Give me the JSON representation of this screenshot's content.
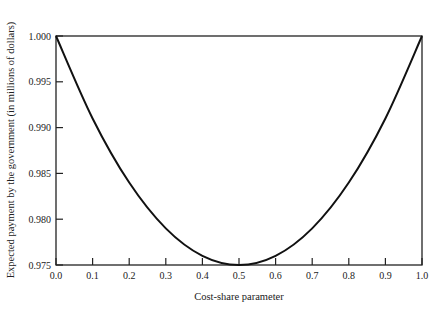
{
  "chart_data": {
    "type": "line",
    "title": "",
    "xlabel": "Cost-share parameter",
    "ylabel": "Expected payment by the government (in millions of dollars)",
    "xlim": [
      0.0,
      1.0
    ],
    "ylim": [
      0.975,
      1.0
    ],
    "grid": false,
    "legend": null,
    "x_ticks": [
      "0.0",
      "0.1",
      "0.2",
      "0.3",
      "0.4",
      "0.5",
      "0.6",
      "0.7",
      "0.8",
      "0.9",
      "1.0"
    ],
    "y_ticks": [
      "0.975",
      "0.980",
      "0.985",
      "0.990",
      "0.995",
      "1.000"
    ],
    "series": [
      {
        "name": "Expected payment",
        "x": [
          0.0,
          0.1,
          0.2,
          0.3,
          0.4,
          0.5,
          0.6,
          0.7,
          0.8,
          0.9,
          1.0
        ],
        "y": [
          1.0,
          0.991,
          0.984,
          0.979,
          0.976,
          0.975,
          0.976,
          0.979,
          0.984,
          0.991,
          1.0
        ]
      }
    ],
    "line_color": "#111111"
  }
}
